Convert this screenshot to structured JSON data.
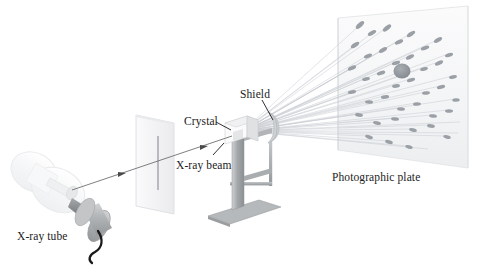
{
  "figure": {
    "background_color": "#ffffff",
    "width": 477,
    "height": 270
  },
  "labels": {
    "xray_tube": "X-ray tube",
    "crystal": "Crystal",
    "shield": "Shield",
    "xray_beam": "X-ray beam",
    "photographic_plate": "Photographic plate"
  },
  "colors": {
    "label_text": "#1b1b1b",
    "leader_line": "#1b1b1b",
    "beam_line": "#6f6f6f",
    "diffracted_ray": "#c9cdd2",
    "plate_face": "#f4f5f6",
    "plate_edge": "#d7dadd",
    "crystal_face": "#fbfbfb",
    "crystal_shade": "#d9dadc",
    "stand_gray": "#a8abad",
    "stand_dark": "#8e9193",
    "shield_gray": "#cfd2d5",
    "tube_glass": "#f2f3f4",
    "tube_housing": "#b9bbbd",
    "tube_cable": "#1a1a1a",
    "spot_fill": "#9aa0a6",
    "center_spot": "#8b9197",
    "slit_line": "#a9adb1"
  },
  "components": {
    "xray_tube": {
      "name": "X-ray tube",
      "description": "Evacuated glass envelope with cylindrical housing and high-voltage cable"
    },
    "collimator": {
      "name": "Collimator plate",
      "description": "Upright plate with a narrow vertical slit that collimates the beam"
    },
    "crystal": {
      "name": "Crystal",
      "description": "Small single crystal cube mounted on a post with an L-shaped base"
    },
    "shield": {
      "name": "Shield",
      "description": "Curved beam stop on a thin arm that blocks the undiffracted direct beam"
    },
    "photographic_plate": {
      "name": "Photographic plate",
      "description": "Flat plate recording the Laue diffraction spot pattern"
    }
  },
  "beam": {
    "direct_label": "X-ray beam",
    "arrow_count": 2,
    "diffracted_ray_count": 26
  },
  "diffraction_pattern": {
    "description": "Laue spots: elongated elliptical blackening radiating from a central direct-beam spot",
    "center_spot": true,
    "spot_count": 36
  }
}
